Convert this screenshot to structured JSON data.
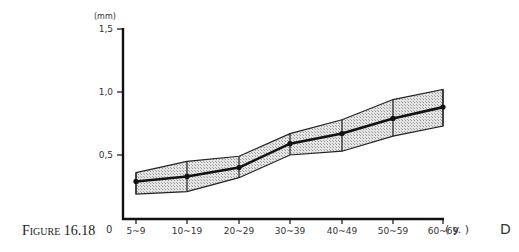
{
  "chart_data": {
    "type": "line",
    "title": "",
    "caption": "Figure 16.18",
    "xlabel": "( y. )",
    "ylabel": "(mm)",
    "corner_label": "D",
    "origin_label": "0",
    "categories": [
      "5~9",
      "10~19",
      "20~29",
      "30~39",
      "40~49",
      "50~59",
      "60~69"
    ],
    "series": [
      {
        "name": "mean",
        "values": [
          0.29,
          0.33,
          0.4,
          0.59,
          0.67,
          0.79,
          0.88
        ]
      },
      {
        "name": "upper",
        "values": [
          0.36,
          0.45,
          0.49,
          0.67,
          0.78,
          0.94,
          1.02
        ]
      },
      {
        "name": "lower",
        "values": [
          0.19,
          0.21,
          0.32,
          0.5,
          0.53,
          0.65,
          0.73
        ]
      }
    ],
    "yticks": [
      "0,5",
      "1,0",
      "1,5"
    ],
    "ytick_values": [
      0.5,
      1.0,
      1.5
    ],
    "ylim": [
      0,
      1.5
    ],
    "grid": false,
    "legend": "none",
    "band_fill": "hatched gray"
  },
  "caption": {
    "text": "Figure 16.18"
  },
  "axis": {
    "origin": "0",
    "x_unit": "( y. )",
    "y_unit": "(mm)",
    "corner": "D"
  }
}
